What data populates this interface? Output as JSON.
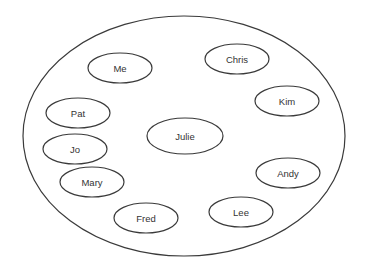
{
  "diagram": {
    "type": "set-membership",
    "container": {
      "label": ""
    },
    "members": [
      {
        "id": "me",
        "label": "Me"
      },
      {
        "id": "chris",
        "label": "Chris"
      },
      {
        "id": "kim",
        "label": "Kim"
      },
      {
        "id": "pat",
        "label": "Pat"
      },
      {
        "id": "julie",
        "label": "Julie"
      },
      {
        "id": "jo",
        "label": "Jo"
      },
      {
        "id": "mary",
        "label": "Mary"
      },
      {
        "id": "andy",
        "label": "Andy"
      },
      {
        "id": "fred",
        "label": "Fred"
      },
      {
        "id": "lee",
        "label": "Lee"
      }
    ]
  }
}
